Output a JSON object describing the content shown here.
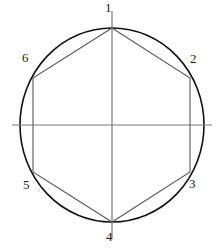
{
  "figure": {
    "name": "circle-with-inscribed-hexagon",
    "background_color": "#ffffff",
    "circle": {
      "stroke_color": "#111111",
      "stroke_width": 1.6,
      "fill": "none",
      "center_x": 112,
      "center_y": 125,
      "radius_x": 92,
      "radius_y": 97
    },
    "axes": {
      "stroke_color": "#7a7a7a",
      "stroke_width": 1.2,
      "horizontal": {
        "x1": 12,
        "y1": 125,
        "x2": 212,
        "y2": 125
      },
      "vertical": {
        "x1": 112,
        "y1": 11,
        "x2": 112,
        "y2": 238
      }
    },
    "hexagon": {
      "stroke_color": "#5a5a5a",
      "stroke_width": 1.1,
      "fill": "none",
      "vertices": [
        {
          "id": "1",
          "x": 112,
          "y": 28,
          "label": "1",
          "label_x": 108,
          "label_y": 2,
          "label_name": "vertex-label-1"
        },
        {
          "id": "2",
          "x": 190,
          "y": 78,
          "label": "2",
          "label_x": 191,
          "label_y": 53,
          "label_name": "vertex-label-2"
        },
        {
          "id": "3",
          "x": 190,
          "y": 172,
          "label": "3",
          "label_x": 190,
          "label_y": 176,
          "label_name": "vertex-label-3"
        },
        {
          "id": "4",
          "x": 112,
          "y": 222,
          "label": "4",
          "label_x": 108,
          "label_y": 229,
          "label_name": "vertex-label-4"
        },
        {
          "id": "5",
          "x": 33,
          "y": 172,
          "label": "5",
          "label_x": 25,
          "label_y": 178,
          "label_name": "vertex-label-5"
        },
        {
          "id": "6",
          "x": 33,
          "y": 78,
          "label": "6",
          "label_x": 24,
          "label_y": 52,
          "label_name": "vertex-label-6"
        }
      ],
      "edges": [
        {
          "from": "6",
          "to": "1"
        },
        {
          "from": "1",
          "to": "2"
        },
        {
          "from": "2",
          "to": "3"
        },
        {
          "from": "3",
          "to": "4"
        },
        {
          "from": "4",
          "to": "5"
        },
        {
          "from": "5",
          "to": "6"
        }
      ]
    }
  },
  "chart_data": {
    "type": "scatter",
    "title": "",
    "subtitle": "",
    "xlabel": "",
    "ylabel": "",
    "grid": false,
    "legend": null,
    "annotations": [
      "Circle circumscribing a regular hexagon",
      "Horizontal diameter through centre",
      "Vertical diameter through centre"
    ],
    "point_labels": [
      "1",
      "2",
      "3",
      "4",
      "5",
      "6"
    ],
    "points_px": [
      {
        "label": "1",
        "x": 112,
        "y": 28
      },
      {
        "label": "2",
        "x": 190,
        "y": 78
      },
      {
        "label": "3",
        "x": 190,
        "y": 172
      },
      {
        "label": "4",
        "x": 112,
        "y": 222
      },
      {
        "label": "5",
        "x": 33,
        "y": 172
      },
      {
        "label": "6",
        "x": 33,
        "y": 78
      }
    ]
  }
}
